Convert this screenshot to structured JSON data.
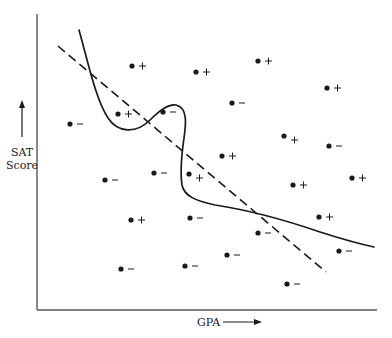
{
  "chart_data": {
    "type": "scatter",
    "title": "",
    "xlabel": "GPA",
    "ylabel": "SAT Score",
    "ylabel_lines": [
      "SAT",
      "Score"
    ],
    "grid": false,
    "legend": null,
    "axes_px": {
      "x0": 37,
      "x1": 377,
      "y_top": 14,
      "y_bottom": 310
    },
    "points": [
      {
        "x": 132,
        "y": 66,
        "label": "+"
      },
      {
        "x": 196,
        "y": 72,
        "label": "+"
      },
      {
        "x": 258,
        "y": 61,
        "label": "+"
      },
      {
        "x": 327,
        "y": 88,
        "label": "+"
      },
      {
        "x": 232,
        "y": 103,
        "label": "-"
      },
      {
        "x": 118,
        "y": 114,
        "label": "+"
      },
      {
        "x": 163,
        "y": 112,
        "label": "-"
      },
      {
        "x": 70,
        "y": 124,
        "label": "-"
      },
      {
        "x": 284,
        "y": 136,
        "label": "+",
        "offset": "low"
      },
      {
        "x": 329,
        "y": 146,
        "label": "-"
      },
      {
        "x": 222,
        "y": 156,
        "label": "+"
      },
      {
        "x": 154,
        "y": 173,
        "label": "-"
      },
      {
        "x": 189,
        "y": 174,
        "label": "+",
        "offset": "low"
      },
      {
        "x": 105,
        "y": 180,
        "label": "-"
      },
      {
        "x": 352,
        "y": 178,
        "label": "+"
      },
      {
        "x": 293,
        "y": 185,
        "label": "+"
      },
      {
        "x": 131,
        "y": 220,
        "label": "+"
      },
      {
        "x": 190,
        "y": 218,
        "label": "-"
      },
      {
        "x": 319,
        "y": 217,
        "label": "+"
      },
      {
        "x": 258,
        "y": 233,
        "label": "-"
      },
      {
        "x": 339,
        "y": 251,
        "label": "-"
      },
      {
        "x": 227,
        "y": 255,
        "label": "-"
      },
      {
        "x": 185,
        "y": 266,
        "label": "-"
      },
      {
        "x": 121,
        "y": 269,
        "label": "-"
      },
      {
        "x": 287,
        "y": 284,
        "label": "-"
      }
    ],
    "curves": [
      {
        "name": "linear-decision-boundary",
        "style": "dashed",
        "from": [
          58,
          46
        ],
        "to": [
          326,
          272
        ]
      },
      {
        "name": "nonlinear-decision-boundary",
        "style": "solid",
        "path": "M79,30 C88,62 96,100 108,118 C118,133 136,134 150,120 C160,110 168,104 176,105 C188,108 186,124 184,138 C182,152 180,172 182,185 C184,196 196,201 215,205 C248,210 285,220 320,232 C345,240 360,244 374,247"
      }
    ],
    "annotation_symbols": {
      "plus": "+",
      "minus": "−"
    }
  },
  "labels": {
    "ylabel_line1": "SAT",
    "ylabel_line2": "Score",
    "xlabel": "GPA"
  },
  "colors": {
    "ink": "#1a1a1a",
    "axis": "#555555",
    "background": "#ffffff"
  }
}
